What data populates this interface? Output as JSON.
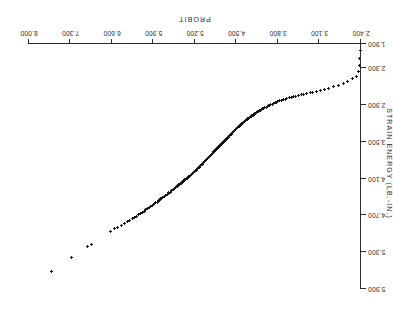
{
  "chart_data": {
    "type": "scatter",
    "title": "",
    "subtitle": "",
    "xlabel": "PROBIT",
    "ylabel": "STRAIN ENERGY (LB.-IN.)",
    "orientation": "rotated-180",
    "grid": false,
    "legend": null,
    "marker": "plus-cross",
    "marker_color": "#161616",
    "xlim": [
      2.4,
      8.0
    ],
    "ylim": [
      1.9,
      5.9
    ],
    "xticks": [
      8.0,
      7.3,
      6.6,
      5.9,
      5.2,
      4.5,
      3.8,
      3.1,
      2.4
    ],
    "xtick_labels": [
      "8.000",
      "7.300",
      "6.600",
      "5.900",
      "5.200",
      "4.500",
      "3.800",
      "3.100",
      "2.400"
    ],
    "yticks": [
      5.9,
      5.3,
      4.7,
      4.1,
      3.5,
      2.9,
      2.3,
      1.9
    ],
    "ytick_labels": [
      "5.900",
      "5.300",
      "4.700",
      "4.100",
      "3.500",
      "2.900",
      "2.300",
      "1.900"
    ],
    "ytick_labels_shown": [
      "5.900",
      "4.900",
      "4.300",
      "3.700",
      "3.100",
      "2.500",
      "1.900"
    ],
    "n_points": 214,
    "x": [
      7.62,
      7.28,
      7.02,
      6.95,
      6.62,
      6.56,
      6.5,
      6.44,
      6.39,
      6.34,
      6.3,
      6.26,
      6.22,
      6.18,
      6.15,
      6.12,
      6.09,
      6.06,
      6.03,
      6.0,
      5.97,
      5.95,
      5.92,
      5.9,
      5.88,
      5.86,
      5.84,
      5.82,
      5.8,
      5.78,
      5.76,
      5.74,
      5.72,
      5.7,
      5.69,
      5.67,
      5.65,
      5.64,
      5.62,
      5.6,
      5.59,
      5.57,
      5.56,
      5.54,
      5.53,
      5.51,
      5.5,
      5.49,
      5.47,
      5.46,
      5.45,
      5.43,
      5.42,
      5.41,
      5.39,
      5.38,
      5.37,
      5.36,
      5.34,
      5.33,
      5.32,
      5.31,
      5.3,
      5.28,
      5.27,
      5.26,
      5.25,
      5.24,
      5.23,
      5.22,
      5.21,
      5.19,
      5.18,
      5.17,
      5.16,
      5.15,
      5.14,
      5.13,
      5.12,
      5.11,
      5.1,
      5.09,
      5.08,
      5.07,
      5.06,
      5.05,
      5.04,
      5.03,
      5.02,
      5.01,
      5.0,
      4.99,
      4.98,
      4.97,
      4.96,
      4.95,
      4.94,
      4.93,
      4.92,
      4.91,
      4.9,
      4.89,
      4.88,
      4.87,
      4.86,
      4.85,
      4.84,
      4.83,
      4.82,
      4.81,
      4.8,
      4.79,
      4.78,
      4.77,
      4.76,
      4.75,
      4.74,
      4.73,
      4.72,
      4.71,
      4.7,
      4.69,
      4.68,
      4.67,
      4.66,
      4.65,
      4.64,
      4.63,
      4.62,
      4.61,
      4.6,
      4.59,
      4.58,
      4.57,
      4.56,
      4.55,
      4.54,
      4.53,
      4.52,
      4.51,
      4.5,
      4.49,
      4.48,
      4.47,
      4.45,
      4.44,
      4.43,
      4.42,
      4.41,
      4.4,
      4.38,
      4.37,
      4.36,
      4.35,
      4.33,
      4.32,
      4.31,
      4.29,
      4.28,
      4.27,
      4.25,
      4.24,
      4.22,
      4.21,
      4.19,
      4.18,
      4.16,
      4.15,
      4.13,
      4.11,
      4.1,
      4.08,
      4.06,
      4.04,
      4.02,
      4.0,
      3.98,
      3.96,
      3.94,
      3.92,
      3.9,
      3.87,
      3.85,
      3.82,
      3.8,
      3.77,
      3.74,
      3.71,
      3.68,
      3.65,
      3.61,
      3.58,
      3.54,
      3.5,
      3.46,
      3.41,
      3.37,
      3.32,
      3.26,
      3.21,
      3.15,
      3.08,
      3.01,
      2.94,
      2.86,
      2.78,
      2.7,
      2.62,
      2.54,
      2.47,
      2.44,
      2.43,
      2.42,
      2.41
    ],
    "y": [
      5.62,
      5.38,
      5.21,
      5.18,
      4.96,
      4.92,
      4.89,
      4.86,
      4.83,
      4.8,
      4.78,
      4.75,
      4.73,
      4.71,
      4.69,
      4.67,
      4.65,
      4.63,
      4.61,
      4.59,
      4.57,
      4.56,
      4.54,
      4.52,
      4.51,
      4.49,
      4.48,
      4.46,
      4.45,
      4.43,
      4.42,
      4.41,
      4.39,
      4.38,
      4.37,
      4.35,
      4.34,
      4.33,
      4.32,
      4.3,
      4.29,
      4.28,
      4.27,
      4.26,
      4.25,
      4.23,
      4.22,
      4.21,
      4.2,
      4.19,
      4.18,
      4.17,
      4.16,
      4.15,
      4.14,
      4.13,
      4.12,
      4.11,
      4.1,
      4.09,
      4.08,
      4.07,
      4.06,
      4.05,
      4.04,
      4.03,
      4.02,
      4.01,
      4.0,
      3.99,
      3.98,
      3.97,
      3.96,
      3.95,
      3.94,
      3.93,
      3.92,
      3.91,
      3.9,
      3.89,
      3.88,
      3.87,
      3.86,
      3.85,
      3.84,
      3.83,
      3.82,
      3.81,
      3.8,
      3.79,
      3.78,
      3.77,
      3.76,
      3.75,
      3.74,
      3.73,
      3.72,
      3.71,
      3.7,
      3.69,
      3.68,
      3.67,
      3.66,
      3.65,
      3.64,
      3.63,
      3.62,
      3.61,
      3.6,
      3.59,
      3.58,
      3.57,
      3.56,
      3.55,
      3.54,
      3.53,
      3.52,
      3.51,
      3.5,
      3.49,
      3.48,
      3.47,
      3.46,
      3.45,
      3.44,
      3.43,
      3.42,
      3.41,
      3.4,
      3.39,
      3.38,
      3.37,
      3.36,
      3.35,
      3.34,
      3.33,
      3.32,
      3.31,
      3.3,
      3.29,
      3.28,
      3.27,
      3.26,
      3.25,
      3.24,
      3.23,
      3.22,
      3.21,
      3.2,
      3.19,
      3.18,
      3.17,
      3.16,
      3.15,
      3.14,
      3.13,
      3.12,
      3.11,
      3.1,
      3.09,
      3.08,
      3.07,
      3.06,
      3.05,
      3.04,
      3.03,
      3.02,
      3.01,
      3.0,
      2.99,
      2.98,
      2.97,
      2.96,
      2.95,
      2.94,
      2.93,
      2.92,
      2.91,
      2.9,
      2.89,
      2.88,
      2.87,
      2.86,
      2.85,
      2.84,
      2.83,
      2.82,
      2.81,
      2.8,
      2.79,
      2.78,
      2.77,
      2.76,
      2.75,
      2.74,
      2.73,
      2.72,
      2.71,
      2.7,
      2.69,
      2.68,
      2.66,
      2.64,
      2.62,
      2.6,
      2.57,
      2.54,
      2.51,
      2.47,
      2.43,
      2.35,
      2.25,
      2.13,
      2.0
    ]
  }
}
